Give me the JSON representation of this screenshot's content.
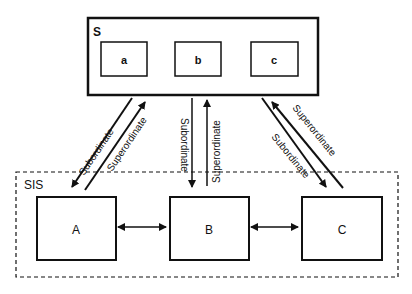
{
  "outer_top": {
    "label": "S",
    "boxes": [
      "a",
      "b",
      "c"
    ]
  },
  "outer_bottom": {
    "label": "SIS",
    "boxes": [
      "A",
      "B",
      "C"
    ]
  },
  "edges": [
    {
      "from": "S",
      "to": "A",
      "label": "Subordinate",
      "direction": "down"
    },
    {
      "from": "A",
      "to": "S",
      "label": "Superordinate",
      "direction": "up"
    },
    {
      "from": "S",
      "to": "B",
      "label": "Subordinate",
      "direction": "down"
    },
    {
      "from": "B",
      "to": "S",
      "label": "Superordinate",
      "direction": "up"
    },
    {
      "from": "S",
      "to": "C",
      "label": "Subordinate",
      "direction": "down"
    },
    {
      "from": "C",
      "to": "S",
      "label": "Superordinate",
      "direction": "up"
    },
    {
      "from": "A",
      "to": "B",
      "label": "",
      "direction": "both"
    },
    {
      "from": "B",
      "to": "C",
      "label": "",
      "direction": "both"
    }
  ]
}
